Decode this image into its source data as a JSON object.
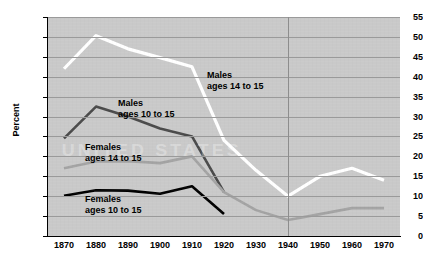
{
  "chart_data": {
    "type": "line",
    "title": "",
    "subtitle": "",
    "xlabel": "",
    "ylabel": "Percent",
    "xlim": [
      1865,
      1975
    ],
    "ylim": [
      0,
      55
    ],
    "y_ticks": [
      0,
      5,
      10,
      15,
      20,
      25,
      30,
      35,
      40,
      45,
      50,
      55
    ],
    "x_ticks": [
      1870,
      1880,
      1890,
      1900,
      1910,
      1920,
      1930,
      1940,
      1950,
      1960,
      1970
    ],
    "grid": "horizontal-and-vertical-at-1940",
    "legend": "inline-annotations",
    "plot_background": "#c9c9c9",
    "watermark_text": "UNITED STATES",
    "series": [
      {
        "name": "Males ages 14 to 15",
        "label_line1": "Males",
        "label_line2": "ages 14 to 15",
        "color": "#ffffff",
        "x": [
          1870,
          1880,
          1890,
          1900,
          1910,
          1920,
          1930,
          1940,
          1950,
          1960,
          1970
        ],
        "values": [
          42.0,
          50.3,
          47.0,
          44.8,
          42.5,
          24.0,
          16.5,
          10.0,
          15.0,
          17.0,
          14.0
        ]
      },
      {
        "name": "Males ages 10 to 15",
        "label_line1": "Males",
        "label_line2": "ages 10 to 15",
        "color": "#4a4a4a",
        "x": [
          1870,
          1880,
          1890,
          1900,
          1910,
          1920
        ],
        "values": [
          24.5,
          32.5,
          30.0,
          27.0,
          25.0,
          11.0
        ]
      },
      {
        "name": "Females ages 14 to 15",
        "label_line1": "Females",
        "label_line2": "ages 14 to 15",
        "color": "#a3a3a3",
        "x": [
          1870,
          1880,
          1890,
          1900,
          1910,
          1920,
          1930,
          1940,
          1950,
          1960,
          1970
        ],
        "values": [
          17.0,
          18.7,
          18.8,
          18.3,
          20.0,
          11.0,
          6.5,
          4.0,
          5.5,
          7.0,
          7.0
        ]
      },
      {
        "name": "Females ages 10 to 15",
        "label_line1": "Females",
        "label_line2": "ages 10 to 15",
        "color": "#000000",
        "x": [
          1870,
          1880,
          1890,
          1900,
          1910,
          1920
        ],
        "values": [
          10.1,
          11.5,
          11.4,
          10.6,
          12.5,
          5.5
        ]
      }
    ]
  }
}
